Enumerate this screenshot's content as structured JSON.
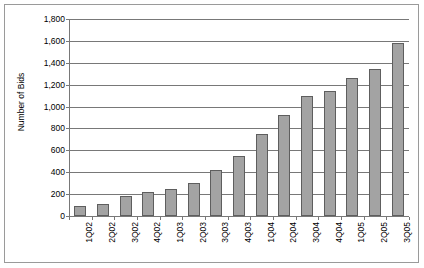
{
  "chart_data": {
    "type": "bar",
    "title": "",
    "xlabel": "",
    "ylabel": "Number of Bids",
    "ylim": [
      0,
      1800
    ],
    "ytick_step": 200,
    "grid": true,
    "legend": false,
    "bar_color": "#a3a3a3",
    "bar_border_color": "#5e5e5e",
    "axis_color": "#787878",
    "categories": [
      "1Q02",
      "2Q02",
      "3Q02",
      "4Q02",
      "1Q03",
      "2Q03",
      "3Q03",
      "4Q03",
      "1Q04",
      "2Q04",
      "3Q04",
      "4Q04",
      "1Q05",
      "2Q05",
      "3Q05"
    ],
    "values": [
      95,
      110,
      185,
      220,
      245,
      305,
      420,
      550,
      750,
      925,
      1095,
      1145,
      1265,
      1345,
      1580
    ],
    "ytick_labels": [
      "0",
      "200",
      "400",
      "600",
      "800",
      "1,000",
      "1,200",
      "1,400",
      "1,600",
      "1,800"
    ],
    "ytick_values": [
      0,
      200,
      400,
      600,
      800,
      1000,
      1200,
      1400,
      1600,
      1800
    ]
  }
}
